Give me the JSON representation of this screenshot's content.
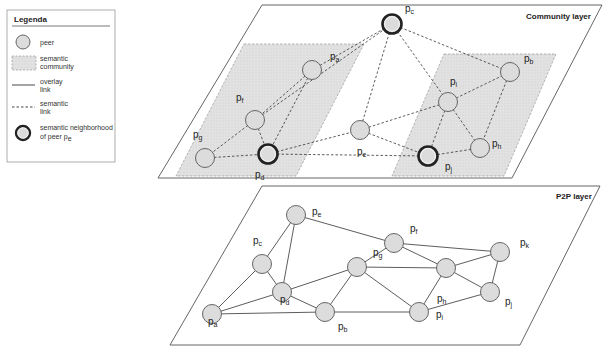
{
  "legend": {
    "title": "Legenda",
    "items": [
      {
        "symbol": "circle",
        "label_lines": [
          "peer"
        ]
      },
      {
        "symbol": "grey-area",
        "label_lines": [
          "semantic",
          "community"
        ]
      },
      {
        "symbol": "solid-line",
        "label_lines": [
          "overlay",
          "link"
        ]
      },
      {
        "symbol": "dashed-line",
        "label_lines": [
          "semantic",
          "link"
        ]
      },
      {
        "symbol": "double-circle",
        "label_lines": [
          "semantic neighborhood",
          "of peer p"
        ],
        "label_sub": "e"
      }
    ]
  },
  "community_layer": {
    "title": "Community layer",
    "nodes": [
      {
        "id": "a",
        "x": 312,
        "y": 70,
        "lx": 330,
        "ly": 60,
        "highlight": false
      },
      {
        "id": "f",
        "x": 255,
        "y": 120,
        "lx": 236,
        "ly": 101,
        "highlight": false
      },
      {
        "id": "g",
        "x": 205,
        "y": 158,
        "lx": 193,
        "ly": 138,
        "highlight": false
      },
      {
        "id": "d",
        "x": 268,
        "y": 154,
        "lx": 255,
        "ly": 178,
        "highlight": true
      },
      {
        "id": "c",
        "x": 392,
        "y": 24,
        "lx": 405,
        "ly": 12,
        "highlight": true
      },
      {
        "id": "e",
        "x": 360,
        "y": 130,
        "lx": 357,
        "ly": 155,
        "highlight": false
      },
      {
        "id": "i",
        "x": 448,
        "y": 102,
        "lx": 450,
        "ly": 85,
        "highlight": false
      },
      {
        "id": "b",
        "x": 510,
        "y": 72,
        "lx": 524,
        "ly": 62,
        "highlight": false
      },
      {
        "id": "h",
        "x": 480,
        "y": 148,
        "lx": 492,
        "ly": 147,
        "highlight": false
      },
      {
        "id": "j",
        "x": 428,
        "y": 156,
        "lx": 445,
        "ly": 170,
        "highlight": true
      }
    ],
    "links": [
      [
        "a",
        "f"
      ],
      [
        "a",
        "d"
      ],
      [
        "f",
        "g"
      ],
      [
        "f",
        "d"
      ],
      [
        "g",
        "d"
      ],
      [
        "a",
        "c"
      ],
      [
        "f",
        "c"
      ],
      [
        "c",
        "e"
      ],
      [
        "c",
        "i"
      ],
      [
        "c",
        "b"
      ],
      [
        "d",
        "e"
      ],
      [
        "e",
        "j"
      ],
      [
        "e",
        "i"
      ],
      [
        "i",
        "b"
      ],
      [
        "i",
        "h"
      ],
      [
        "i",
        "j"
      ],
      [
        "b",
        "h"
      ],
      [
        "h",
        "j"
      ],
      [
        "d",
        "j"
      ]
    ]
  },
  "p2p_layer": {
    "title": "P2P layer",
    "nodes": [
      {
        "id": "c",
        "x": 262,
        "y": 264,
        "lx": 253,
        "ly": 244
      },
      {
        "id": "e",
        "x": 296,
        "y": 215,
        "lx": 312,
        "ly": 215
      },
      {
        "id": "d",
        "x": 282,
        "y": 292,
        "lx": 280,
        "ly": 303
      },
      {
        "id": "a",
        "x": 212,
        "y": 314,
        "lx": 208,
        "ly": 325
      },
      {
        "id": "b",
        "x": 325,
        "y": 312,
        "lx": 338,
        "ly": 330
      },
      {
        "id": "g",
        "x": 357,
        "y": 267,
        "lx": 373,
        "ly": 256
      },
      {
        "id": "f",
        "x": 394,
        "y": 243,
        "lx": 410,
        "ly": 232
      },
      {
        "id": "h",
        "x": 446,
        "y": 268,
        "lx": 437,
        "ly": 302
      },
      {
        "id": "k",
        "x": 500,
        "y": 252,
        "lx": 520,
        "ly": 246
      },
      {
        "id": "i",
        "x": 419,
        "y": 312,
        "lx": 436,
        "ly": 318
      },
      {
        "id": "j",
        "x": 490,
        "y": 292,
        "lx": 505,
        "ly": 305
      }
    ],
    "links": [
      [
        "c",
        "e"
      ],
      [
        "c",
        "d"
      ],
      [
        "c",
        "a"
      ],
      [
        "e",
        "d"
      ],
      [
        "e",
        "f"
      ],
      [
        "d",
        "a"
      ],
      [
        "d",
        "b"
      ],
      [
        "d",
        "g"
      ],
      [
        "a",
        "b"
      ],
      [
        "b",
        "g"
      ],
      [
        "b",
        "i"
      ],
      [
        "g",
        "f"
      ],
      [
        "g",
        "h"
      ],
      [
        "f",
        "h"
      ],
      [
        "f",
        "k"
      ],
      [
        "h",
        "k"
      ],
      [
        "h",
        "j"
      ],
      [
        "h",
        "i"
      ],
      [
        "i",
        "j"
      ],
      [
        "k",
        "j"
      ],
      [
        "g",
        "i"
      ]
    ]
  },
  "colors": {
    "node_fill": "#dcdcdc",
    "node_stroke": "#666666",
    "community_fill": "#dedede",
    "highlight_stroke": "#222222"
  }
}
